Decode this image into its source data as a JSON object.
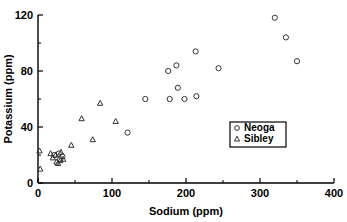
{
  "chart_data": {
    "type": "scatter",
    "title": "",
    "xlabel": "Sodium (ppm)",
    "ylabel": "Potassium (ppm)",
    "xlim": [
      0,
      400
    ],
    "ylim": [
      0,
      120
    ],
    "xticks": [
      0,
      100,
      200,
      300,
      400
    ],
    "xticks_minor": [
      50,
      150,
      250,
      350
    ],
    "yticks": [
      0,
      40,
      80,
      120
    ],
    "yticks_minor": [
      20,
      60,
      100
    ],
    "grid": false,
    "legend_position": "center-right",
    "series": [
      {
        "name": "Neoga",
        "marker": "circle",
        "points": [
          [
            22,
            20
          ],
          [
            28,
            21
          ],
          [
            30,
            17
          ],
          [
            33,
            19
          ],
          [
            121,
            36
          ],
          [
            145,
            60
          ],
          [
            176,
            80
          ],
          [
            178,
            60
          ],
          [
            187,
            84
          ],
          [
            189,
            68
          ],
          [
            198,
            60
          ],
          [
            213,
            94
          ],
          [
            214,
            62
          ],
          [
            244,
            82
          ],
          [
            320,
            118
          ],
          [
            335,
            104
          ],
          [
            350,
            87
          ]
        ]
      },
      {
        "name": "Sibley",
        "marker": "triangle",
        "points": [
          [
            2,
            23
          ],
          [
            3,
            10
          ],
          [
            17,
            21
          ],
          [
            20,
            18
          ],
          [
            24,
            20
          ],
          [
            25,
            15
          ],
          [
            27,
            14
          ],
          [
            30,
            16
          ],
          [
            31,
            22
          ],
          [
            34,
            17
          ],
          [
            45,
            27
          ],
          [
            59,
            46
          ],
          [
            74,
            31
          ],
          [
            84,
            57
          ],
          [
            105,
            44
          ]
        ]
      }
    ]
  },
  "legend": {
    "entries": [
      {
        "label": "Neoga",
        "marker": "circle"
      },
      {
        "label": "Sibley",
        "marker": "triangle"
      }
    ]
  }
}
